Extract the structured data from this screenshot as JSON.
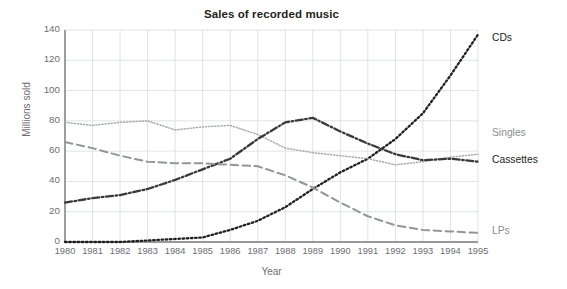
{
  "chart_data": {
    "type": "line",
    "title": "Sales of recorded music",
    "xlabel": "Year",
    "ylabel": "Millions sold",
    "categories": [
      1980,
      1981,
      1982,
      1983,
      1984,
      1985,
      1986,
      1987,
      1988,
      1989,
      1990,
      1991,
      1992,
      1993,
      1994,
      1995
    ],
    "x": [
      "1980",
      "1981",
      "1982",
      "1983",
      "1984",
      "1985",
      "1986",
      "1987",
      "1988",
      "1989",
      "1990",
      "1991",
      "1992",
      "1993",
      "1994",
      "1995"
    ],
    "xlim": [
      1980,
      1995
    ],
    "ylim": [
      0,
      140
    ],
    "yticks": [
      "0",
      "20",
      "40",
      "60",
      "80",
      "100",
      "120",
      "140"
    ],
    "ytick_values": [
      0,
      20,
      40,
      60,
      80,
      100,
      120,
      140
    ],
    "grid": "both",
    "legend_position": "right-of-plot (inline end-of-line labels)",
    "series": [
      {
        "name": "CDs",
        "style": "dotted",
        "color": "#231f20",
        "values": [
          0,
          0,
          0,
          1,
          2,
          3,
          8,
          14,
          23,
          35,
          46,
          55,
          68,
          85,
          110,
          137
        ]
      },
      {
        "name": "Singles",
        "style": "fine-dotted",
        "color": "#a7a9ac",
        "values": [
          79,
          77,
          79,
          80,
          74,
          76,
          77,
          71,
          62,
          59,
          57,
          55,
          51,
          53,
          56,
          58
        ]
      },
      {
        "name": "Cassettes",
        "style": "dash-dot",
        "color": "#3a3a3c",
        "values": [
          26,
          29,
          31,
          35,
          41,
          48,
          55,
          68,
          79,
          82,
          73,
          65,
          58,
          54,
          55,
          53
        ]
      },
      {
        "name": "LPs",
        "style": "dashed",
        "color": "#939598",
        "values": [
          66,
          62,
          57,
          53,
          52,
          52,
          51,
          50,
          44,
          36,
          26,
          17,
          11,
          8,
          7,
          6
        ]
      }
    ]
  },
  "labels": {
    "cds": "CDs",
    "singles": "Singles",
    "cassettes": "Cassettes",
    "lps": "LPs"
  }
}
